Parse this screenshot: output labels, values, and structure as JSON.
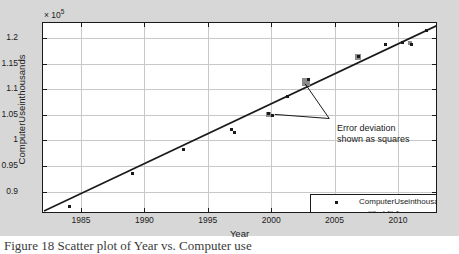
{
  "figure": {
    "background_color": "#d7d7d7",
    "plot_background_color": "#ffffff",
    "grid_color": "#c8c8c8",
    "axis_color": "#1a1a1a",
    "fit_line_color": "#1a1a1a",
    "marker_color": "#1a1a1a",
    "error_square_color": "#8c8c8c"
  },
  "exponent_label": "10",
  "exponent_prefix": "× ",
  "exponent_power": "5",
  "annotation": {
    "line1": "Error deviation",
    "line2": "shown as squares"
  },
  "legend": {
    "entries": [
      {
        "label": "ComputerUseinthousands vs. Year",
        "symbol": "square-marker"
      },
      {
        "label": "untitled fit 1",
        "symbol": "solid-line"
      }
    ]
  },
  "caption": "Figure 18 Scatter plot of Year vs. Computer use",
  "chart_data": {
    "type": "scatter",
    "title": "",
    "xlabel": "Year",
    "ylabel": "ComputerUseinthousands",
    "y_multiplier": 100000,
    "y_multiplier_label": "× 10⁵",
    "xlim": [
      1982,
      2013
    ],
    "ylim": [
      86000,
      123000
    ],
    "xticks": [
      1985,
      1990,
      1995,
      2000,
      2005,
      2010
    ],
    "yticks": [
      0.9,
      0.95,
      1,
      1.05,
      1.1,
      1.15,
      1.2
    ],
    "ytick_labels": [
      "0.9",
      "0.95",
      "1",
      "1.05",
      "1.1",
      "1.15",
      "1.2"
    ],
    "xtick_labels": [
      "1985",
      "1990",
      "1995",
      "2000",
      "2005",
      "2010"
    ],
    "grid": true,
    "legend_position": "lower right",
    "series": [
      {
        "name": "ComputerUseinthousands vs. Year",
        "type": "scatter",
        "marker": "square",
        "color": "#1a1a1a",
        "points": [
          {
            "x": 1984.0,
            "y": 87300
          },
          {
            "x": 1989.0,
            "y": 93800
          },
          {
            "x": 1993.0,
            "y": 98500
          },
          {
            "x": 1996.8,
            "y": 102300
          },
          {
            "x": 1997.0,
            "y": 101800
          },
          {
            "x": 1999.7,
            "y": 105500
          },
          {
            "x": 2000.0,
            "y": 105000
          },
          {
            "x": 2001.2,
            "y": 108800
          },
          {
            "x": 2002.9,
            "y": 112200
          },
          {
            "x": 2006.8,
            "y": 116700
          },
          {
            "x": 2008.9,
            "y": 119000
          },
          {
            "x": 2010.3,
            "y": 119400
          },
          {
            "x": 2011.0,
            "y": 119000
          },
          {
            "x": 2012.2,
            "y": 121800
          }
        ]
      },
      {
        "name": "untitled fit 1",
        "type": "line",
        "color": "#1a1a1a",
        "endpoints": [
          {
            "x": 1982.0,
            "y": 86400
          },
          {
            "x": 2013.0,
            "y": 122700
          }
        ]
      },
      {
        "name": "Error deviation squares",
        "type": "error-squares",
        "color": "#8c8c8c",
        "squares": [
          {
            "x": 1999.7,
            "y": 105300,
            "size": 5
          },
          {
            "x": 2002.7,
            "y": 111700,
            "size": 8
          },
          {
            "x": 2006.8,
            "y": 116600,
            "size": 6
          },
          {
            "x": 2010.9,
            "y": 119300,
            "size": 4
          }
        ]
      }
    ],
    "annotations": [
      {
        "text": "Error deviation shown as squares",
        "x": 2004.5,
        "y": 104500,
        "leader_to": [
          {
            "x": 2002.6,
            "y": 111300
          },
          {
            "x": 2000.2,
            "y": 105300
          }
        ]
      }
    ]
  }
}
